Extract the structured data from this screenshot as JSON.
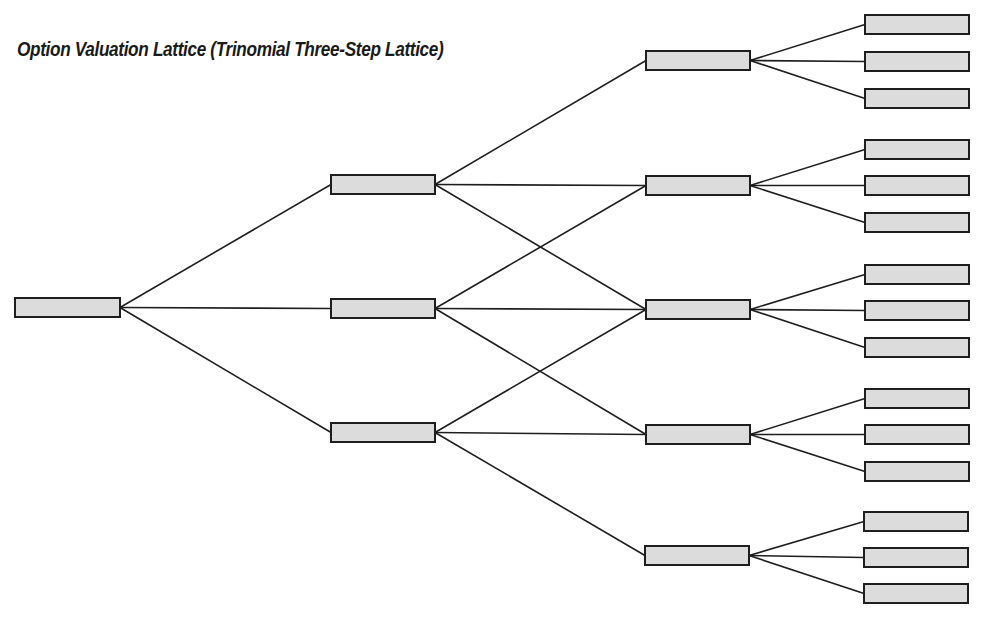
{
  "title": "Option Valuation Lattice (Trinomial Three-Step Lattice)",
  "colors": {
    "node_fill": "#dcdcdc",
    "node_stroke": "#1e1e1e",
    "edge": "#1e1e1e",
    "title": "#1a1a1a",
    "background": "#ffffff"
  },
  "lattice": {
    "type": "trinomial",
    "steps": 3,
    "node_size": {
      "w": 104,
      "h": 19
    },
    "levels": [
      {
        "step": 0,
        "label": "root",
        "nodes": [
          {
            "id": "n0",
            "x": 15,
            "y": 298,
            "w": 105
          }
        ]
      },
      {
        "step": 1,
        "nodes": [
          {
            "id": "n1_up",
            "x": 331,
            "y": 175
          },
          {
            "id": "n1_mid",
            "x": 331,
            "y": 299
          },
          {
            "id": "n1_down",
            "x": 331,
            "y": 423
          }
        ]
      },
      {
        "step": 2,
        "nodes": [
          {
            "id": "n2_uu",
            "x": 646,
            "y": 51
          },
          {
            "id": "n2_u",
            "x": 646,
            "y": 176
          },
          {
            "id": "n2_m",
            "x": 646,
            "y": 300
          },
          {
            "id": "n2_d",
            "x": 646,
            "y": 425
          },
          {
            "id": "n2_dd",
            "x": 645,
            "y": 546
          }
        ]
      },
      {
        "step": 3,
        "nodes": [
          {
            "id": "n3_1",
            "x": 865,
            "y": 15
          },
          {
            "id": "n3_2",
            "x": 865,
            "y": 52
          },
          {
            "id": "n3_3",
            "x": 865,
            "y": 89
          },
          {
            "id": "n3_4",
            "x": 865,
            "y": 140
          },
          {
            "id": "n3_5",
            "x": 865,
            "y": 176
          },
          {
            "id": "n3_6",
            "x": 865,
            "y": 213
          },
          {
            "id": "n3_7",
            "x": 865,
            "y": 265
          },
          {
            "id": "n3_8",
            "x": 865,
            "y": 301
          },
          {
            "id": "n3_9",
            "x": 865,
            "y": 338
          },
          {
            "id": "n3_10",
            "x": 865,
            "y": 389
          },
          {
            "id": "n3_11",
            "x": 865,
            "y": 425
          },
          {
            "id": "n3_12",
            "x": 865,
            "y": 462
          },
          {
            "id": "n3_13",
            "x": 864,
            "y": 512
          },
          {
            "id": "n3_14",
            "x": 864,
            "y": 548
          },
          {
            "id": "n3_15",
            "x": 864,
            "y": 584
          }
        ]
      }
    ],
    "edges": [
      [
        "n0",
        "n1_up"
      ],
      [
        "n0",
        "n1_mid"
      ],
      [
        "n0",
        "n1_down"
      ],
      [
        "n1_up",
        "n2_uu"
      ],
      [
        "n1_up",
        "n2_u"
      ],
      [
        "n1_up",
        "n2_m"
      ],
      [
        "n1_mid",
        "n2_u"
      ],
      [
        "n1_mid",
        "n2_m"
      ],
      [
        "n1_mid",
        "n2_d"
      ],
      [
        "n1_down",
        "n2_m"
      ],
      [
        "n1_down",
        "n2_d"
      ],
      [
        "n1_down",
        "n2_dd"
      ],
      [
        "n2_uu",
        "n3_1"
      ],
      [
        "n2_uu",
        "n3_2"
      ],
      [
        "n2_uu",
        "n3_3"
      ],
      [
        "n2_u",
        "n3_4"
      ],
      [
        "n2_u",
        "n3_5"
      ],
      [
        "n2_u",
        "n3_6"
      ],
      [
        "n2_m",
        "n3_7"
      ],
      [
        "n2_m",
        "n3_8"
      ],
      [
        "n2_m",
        "n3_9"
      ],
      [
        "n2_d",
        "n3_10"
      ],
      [
        "n2_d",
        "n3_11"
      ],
      [
        "n2_d",
        "n3_12"
      ],
      [
        "n2_dd",
        "n3_13"
      ],
      [
        "n2_dd",
        "n3_14"
      ],
      [
        "n2_dd",
        "n3_15"
      ]
    ]
  }
}
